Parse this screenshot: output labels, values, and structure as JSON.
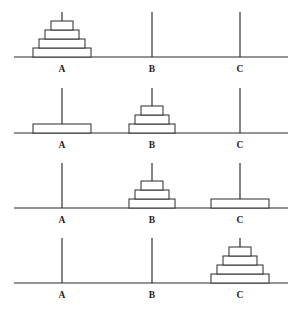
{
  "figure": {
    "peg_labels": [
      "A",
      "B",
      "C"
    ],
    "peg_count": 3,
    "disk_count": 4,
    "panel_count": 4,
    "line_color": "#2b2b2b",
    "disk_fill": "#ffffff",
    "background": "#ffffff"
  },
  "chart_data": {
    "type": "diagram",
    "peg_names": [
      "A",
      "B",
      "C"
    ],
    "disk_sizes": [
      1,
      2,
      3,
      4
    ],
    "panels": [
      {
        "index": 1,
        "baseline_y": 57,
        "pegs": [
          {
            "name": "A",
            "x": 62,
            "peg_top_y": 12,
            "disks": [
              4,
              3,
              2,
              1
            ]
          },
          {
            "name": "B",
            "x": 152,
            "peg_top_y": 12,
            "disks": []
          },
          {
            "name": "C",
            "x": 240,
            "peg_top_y": 12,
            "disks": []
          }
        ]
      },
      {
        "index": 2,
        "baseline_y": 133,
        "pegs": [
          {
            "name": "A",
            "x": 62,
            "peg_top_y": 88,
            "disks": [
              4
            ]
          },
          {
            "name": "B",
            "x": 152,
            "peg_top_y": 88,
            "disks": [
              3,
              2,
              1
            ]
          },
          {
            "name": "C",
            "x": 240,
            "peg_top_y": 88,
            "disks": []
          }
        ]
      },
      {
        "index": 3,
        "baseline_y": 208,
        "pegs": [
          {
            "name": "A",
            "x": 62,
            "peg_top_y": 163,
            "disks": []
          },
          {
            "name": "B",
            "x": 152,
            "peg_top_y": 163,
            "disks": [
              3,
              2,
              1
            ]
          },
          {
            "name": "C",
            "x": 240,
            "peg_top_y": 163,
            "disks": [
              4
            ]
          }
        ]
      },
      {
        "index": 4,
        "baseline_y": 283,
        "pegs": [
          {
            "name": "A",
            "x": 62,
            "peg_top_y": 238,
            "disks": []
          },
          {
            "name": "B",
            "x": 152,
            "peg_top_y": 238,
            "disks": []
          },
          {
            "name": "C",
            "x": 240,
            "peg_top_y": 238,
            "disks": [
              4,
              3,
              2,
              1
            ]
          }
        ]
      }
    ],
    "geometry": {
      "baseline_x_start": 14,
      "baseline_x_end": 288,
      "disk_height": 9,
      "disk_widths": {
        "1": 22,
        "2": 34,
        "3": 46,
        "4": 58
      },
      "label_offset_y": 15
    }
  }
}
